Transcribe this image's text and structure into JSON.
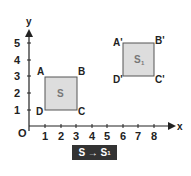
{
  "axes": {
    "x_label": "x",
    "y_label": "y",
    "origin_label": "O",
    "x_ticks": [
      "1",
      "2",
      "3",
      "4",
      "5",
      "6",
      "7",
      "8"
    ],
    "y_ticks": [
      "1",
      "2",
      "3",
      "4",
      "5"
    ]
  },
  "shapes": [
    {
      "name": "S",
      "label": "S",
      "vertices": {
        "A": [
          1,
          3
        ],
        "B": [
          3,
          3
        ],
        "C": [
          3,
          1
        ],
        "D": [
          1,
          1
        ]
      },
      "vertex_labels": {
        "A": "A",
        "B": "B",
        "C": "C",
        "D": "D"
      }
    },
    {
      "name": "S1",
      "label": "S",
      "label_sub": "1",
      "vertices": {
        "A": [
          6,
          5
        ],
        "B": [
          8,
          5
        ],
        "C": [
          8,
          3
        ],
        "D": [
          6,
          3
        ]
      },
      "vertex_labels": {
        "A": "A'",
        "B": "B'",
        "C": "C'",
        "D": "D'"
      }
    }
  ],
  "caption": {
    "text": "S → S",
    "sub": "1"
  },
  "colors": {
    "square_fill": "#dddddd",
    "square_stroke": "#555555",
    "axis": "#222222",
    "caption_bg": "#333333"
  }
}
